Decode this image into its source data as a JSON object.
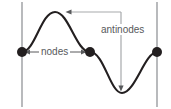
{
  "diagram": {
    "labels": {
      "nodes": "nodes",
      "antinodes": "antinodes"
    },
    "colors": {
      "background": "#ffffff",
      "wave": "#231f20",
      "node_dot": "#231f20",
      "wall_line": "#a7a9ac",
      "leader_line": "#a7a9ac",
      "label_text": "#58595b"
    },
    "geometry": {
      "width": 171,
      "height": 109,
      "axis_y": 52,
      "walls": [
        {
          "name": "left-wall",
          "x": 22,
          "y1": 2,
          "y2": 107
        },
        {
          "name": "right-wall",
          "x": 157,
          "y1": 2,
          "y2": 107
        }
      ],
      "nodes": [
        {
          "name": "node-left",
          "x": 22,
          "y": 52,
          "r": 5
        },
        {
          "name": "node-middle",
          "x": 90,
          "y": 52,
          "r": 5
        },
        {
          "name": "node-right",
          "x": 157,
          "y": 52,
          "r": 5
        }
      ],
      "antinodes": [
        {
          "name": "antinode-crest",
          "x": 55,
          "y": 12
        },
        {
          "name": "antinode-trough",
          "x": 122,
          "y": 93
        }
      ],
      "wave_path": "M22,52 C35,52 41,12 55,12 C69,12 76,52 90,52 C104,52 110,93 122,93 C135,93 145,52 157,52",
      "nodes_measure_arrow": {
        "x1": 26,
        "x2": 86,
        "y": 52
      },
      "antinodes_leader": {
        "arrow_top": {
          "x": 67,
          "y": 12
        },
        "corner": {
          "x": 121,
          "y": 12
        },
        "arrow_bottom": {
          "x": 121,
          "y": 90
        }
      }
    }
  }
}
